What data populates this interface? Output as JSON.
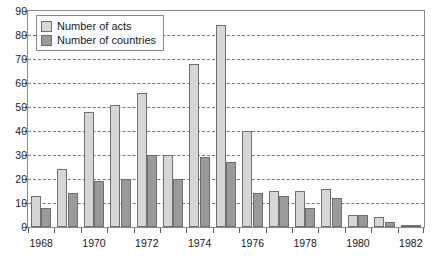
{
  "chart_data": {
    "type": "bar",
    "title": "",
    "subtitle": "",
    "xlabel": "",
    "ylabel": "",
    "ylim": [
      0,
      90
    ],
    "ytick_step": 10,
    "yticks": [
      0,
      10,
      20,
      30,
      40,
      50,
      60,
      70,
      80,
      90
    ],
    "grid": true,
    "grid_style": "dashed-horizontal",
    "legend_position": "top-left-inside",
    "categories": [
      "1968",
      "1969",
      "1970",
      "1971",
      "1972",
      "1973",
      "1974",
      "1975",
      "1976",
      "1977",
      "1978",
      "1979",
      "1980",
      "1981",
      "1982"
    ],
    "xtick_labels_shown": [
      "1968",
      "1970",
      "1972",
      "1974",
      "1976",
      "1978",
      "1980",
      "1982"
    ],
    "series": [
      {
        "name": "Number of acts",
        "color": "#d6d6d6",
        "values": [
          13,
          24,
          48,
          51,
          56,
          30,
          68,
          84,
          40,
          15,
          15,
          16,
          5,
          4,
          1
        ]
      },
      {
        "name": "Number of countries",
        "color": "#9a9a9a",
        "values": [
          8,
          14,
          19,
          20,
          30,
          20,
          29,
          27,
          14,
          13,
          8,
          12,
          5,
          2,
          1
        ]
      }
    ]
  },
  "legend": {
    "items": [
      {
        "label": "Number of acts",
        "swatch": "acts"
      },
      {
        "label": "Number of countries",
        "swatch": "countries"
      }
    ]
  }
}
